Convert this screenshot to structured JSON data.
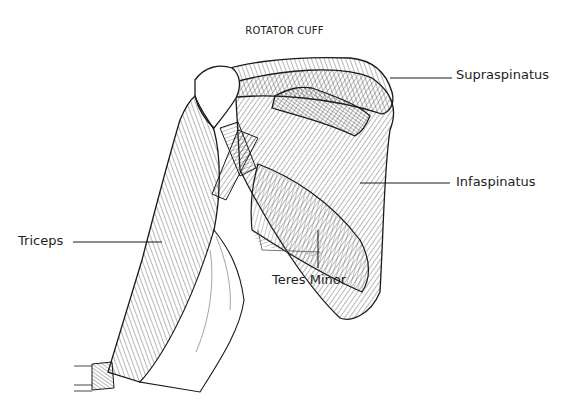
{
  "figure": {
    "title": "ROTATOR CUFF",
    "labels": [
      {
        "id": "supraspinatus",
        "text": "Supraspinatus"
      },
      {
        "id": "infraspinatus",
        "text": "Infaspinatus"
      },
      {
        "id": "triceps",
        "text": "Triceps"
      },
      {
        "id": "teres_minor",
        "text": "Teres Minor"
      }
    ],
    "illustration": "posterior view of right shoulder and upper arm, line drawing of muscles",
    "colors": {
      "line": "#1a1a1a",
      "background": "#ffffff"
    }
  }
}
